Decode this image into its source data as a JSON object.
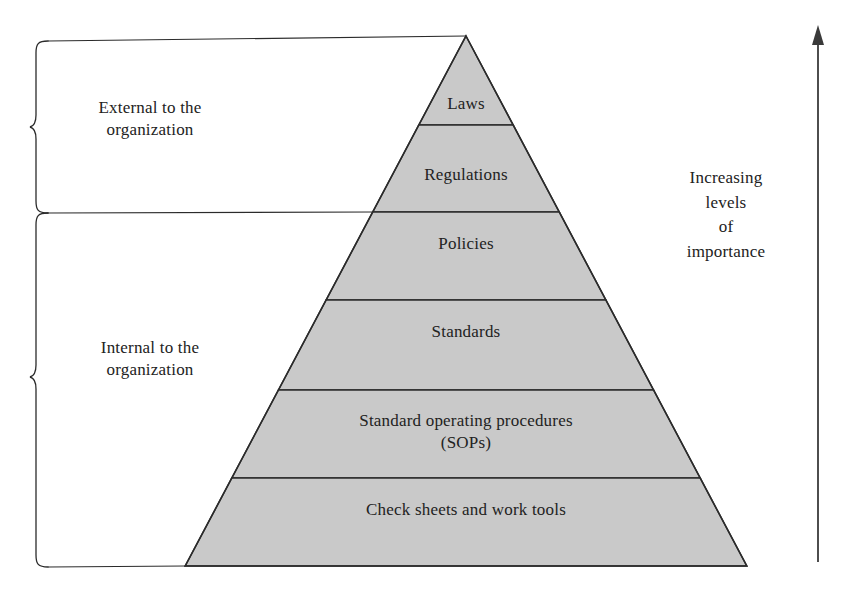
{
  "figure": {
    "type": "pyramid-hierarchy-diagram",
    "background_color": "#ffffff",
    "stroke_color": "#2b2b2b",
    "pyramid_fill": "#c9c9c9"
  },
  "pyramid": {
    "tiers": [
      {
        "label": "Laws",
        "level": 1,
        "position": "apex"
      },
      {
        "label": "Regulations",
        "level": 2
      },
      {
        "label": "Policies",
        "level": 3
      },
      {
        "label": "Standards",
        "level": 4
      },
      {
        "label": "Standard operating procedures\n(SOPs)",
        "level": 5
      },
      {
        "label": "Check sheets and work tools",
        "level": 6,
        "position": "base"
      }
    ]
  },
  "groupings": [
    {
      "label": "External to the\norganization",
      "icon": "curly-brace-icon",
      "covers": [
        "Laws",
        "Regulations"
      ]
    },
    {
      "label": "Internal to the\norganization",
      "icon": "curly-brace-icon",
      "covers": [
        "Policies",
        "Standards",
        "Standard operating procedures (SOPs)",
        "Check sheets and work tools"
      ]
    }
  ],
  "axis": {
    "label": "Increasing\nlevels\nof\nimportance",
    "icon": "up-arrow-icon",
    "direction": "up"
  }
}
